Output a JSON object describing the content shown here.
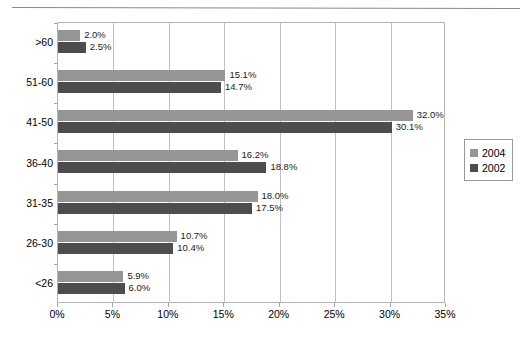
{
  "chart_data": {
    "type": "bar",
    "orientation": "horizontal",
    "title": "",
    "xlabel": "",
    "ylabel": "",
    "xlim": [
      0,
      35
    ],
    "xtick_labels": [
      "0%",
      "5%",
      "10%",
      "15%",
      "20%",
      "25%",
      "30%",
      "35%"
    ],
    "xtick_values": [
      0,
      5,
      10,
      15,
      20,
      25,
      30,
      35
    ],
    "grid": true,
    "grid_axis": "x",
    "legend_position": "right",
    "categories": [
      "<26",
      "26-30",
      "31-35",
      "36-40",
      "41-50",
      "51-60",
      ">60"
    ],
    "categories_top_to_bottom": [
      ">60",
      "51-60",
      "41-50",
      "36-40",
      "31-35",
      "26-30",
      "<26"
    ],
    "series": [
      {
        "name": "2004",
        "color": "#969696",
        "values": [
          5.9,
          10.7,
          18.0,
          16.2,
          32.0,
          15.1,
          2.0
        ],
        "labels": [
          "5.9%",
          "10.7%",
          "18.0%",
          "16.2%",
          "32.0%",
          "15.1%",
          "2.0%"
        ]
      },
      {
        "name": "2002",
        "color": "#4d4d4d",
        "values": [
          6.0,
          10.4,
          17.5,
          18.8,
          30.1,
          14.7,
          2.5
        ],
        "labels": [
          "6.0%",
          "10.4%",
          "17.5%",
          "18.8%",
          "30.1%",
          "14.7%",
          "2.5%"
        ]
      }
    ]
  },
  "legend": {
    "items": [
      {
        "label": "2004",
        "color": "#969696"
      },
      {
        "label": "2002",
        "color": "#4d4d4d"
      }
    ]
  }
}
